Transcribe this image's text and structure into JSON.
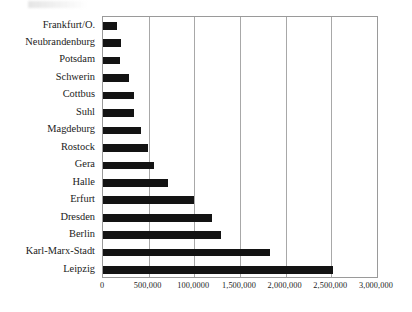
{
  "chart_data": {
    "type": "bar",
    "orientation": "horizontal",
    "title": "",
    "subtitle": "",
    "xlabel": "",
    "ylabel": "",
    "xlim": [
      0,
      3000000
    ],
    "grid": true,
    "legend": null,
    "legend_position": "none",
    "bar_color": "#131313",
    "categories": [
      "Frankfurt/O.",
      "Neubrandenburg",
      "Potsdam",
      "Schwerin",
      "Cottbus",
      "Suhl",
      "Magdeburg",
      "Rostock",
      "Gera",
      "Halle",
      "Erfurt",
      "Dresden",
      "Berlin",
      "Karl-Marx-Stadt",
      "Leipzig"
    ],
    "values": [
      150000,
      200000,
      185000,
      280000,
      340000,
      340000,
      420000,
      490000,
      560000,
      710000,
      1000000,
      1190000,
      1290000,
      1830000,
      2520000
    ],
    "xticks": [
      0,
      500000,
      1000000,
      1500000,
      2000000,
      2500000,
      3000000
    ],
    "xticklabels": [
      "0",
      "500,000",
      "100,0000",
      "1,500,000",
      "2,000,000",
      "2,500,000",
      "3,000,000"
    ]
  }
}
